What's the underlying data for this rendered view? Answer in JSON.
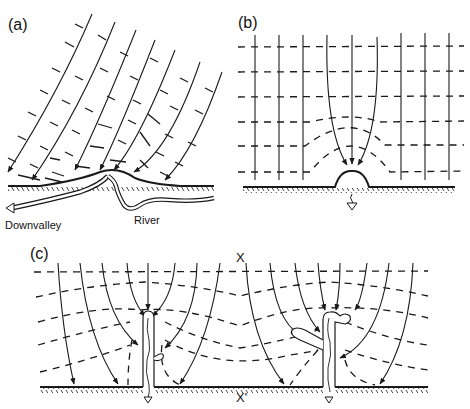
{
  "panels": {
    "a": {
      "label": "(a)",
      "downvalley_label": "Downvalley",
      "river_label": "River"
    },
    "b": {
      "label": "(b)"
    },
    "c": {
      "label": "(c)",
      "section_top_label": "X",
      "section_bottom_label": "X'"
    }
  },
  "legend": {
    "solid_arrows": "flow lines",
    "dashed_lines": "equipotential lines",
    "hatched_line": "ground surface"
  },
  "colors": {
    "ink": "#1a1a1a",
    "background": "#ffffff"
  }
}
